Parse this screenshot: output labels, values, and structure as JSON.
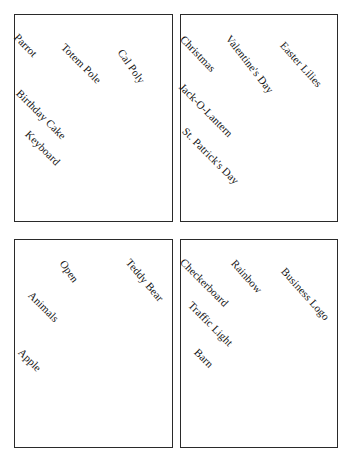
{
  "figure": {
    "type": "scatter-label-panels",
    "background_color": "#ffffff",
    "border_color": "#2a2a2a",
    "text_color": "#151515",
    "panel_count": 4,
    "grid": "2x2"
  },
  "panels": [
    {
      "id": "panel-top-left",
      "x": 14,
      "y": 14,
      "width": 159,
      "height": 208,
      "labels": [
        {
          "text": "Parrot",
          "x": 16,
          "y": 30,
          "angle": 46
        },
        {
          "text": "Totem Pole",
          "x": 63,
          "y": 40,
          "angle": 45
        },
        {
          "text": "Cal Poly",
          "x": 120,
          "y": 45,
          "angle": 55
        },
        {
          "text": "Birthday Cake",
          "x": 18,
          "y": 86,
          "angle": 45
        },
        {
          "text": "Keyboard",
          "x": 27,
          "y": 127,
          "angle": 45
        }
      ]
    },
    {
      "id": "panel-top-right",
      "x": 180,
      "y": 14,
      "width": 158,
      "height": 208,
      "labels": [
        {
          "text": "Christmas",
          "x": 182,
          "y": 32,
          "angle": 46
        },
        {
          "text": "Valentine's Day",
          "x": 228,
          "y": 31,
          "angle": 52
        },
        {
          "text": "Easter Lilies",
          "x": 282,
          "y": 38,
          "angle": 48
        },
        {
          "text": "Jack-O-Lantern",
          "x": 181,
          "y": 80,
          "angle": 45
        },
        {
          "text": "St. Patrick's Day",
          "x": 184,
          "y": 124,
          "angle": 45
        }
      ]
    },
    {
      "id": "panel-bottom-left",
      "x": 14,
      "y": 239,
      "width": 159,
      "height": 209,
      "labels": [
        {
          "text": "Open",
          "x": 62,
          "y": 256,
          "angle": 55
        },
        {
          "text": "Teddy Bear",
          "x": 128,
          "y": 255,
          "angle": 50
        },
        {
          "text": "Animals",
          "x": 30,
          "y": 288,
          "angle": 45
        },
        {
          "text": "Apple",
          "x": 20,
          "y": 345,
          "angle": 45
        }
      ]
    },
    {
      "id": "panel-bottom-right",
      "x": 180,
      "y": 239,
      "width": 158,
      "height": 209,
      "labels": [
        {
          "text": "Checkerboard",
          "x": 182,
          "y": 255,
          "angle": 45
        },
        {
          "text": "Rainbow",
          "x": 233,
          "y": 256,
          "angle": 48
        },
        {
          "text": "Business Logo",
          "x": 283,
          "y": 264,
          "angle": 48
        },
        {
          "text": "Traffic Light",
          "x": 190,
          "y": 298,
          "angle": 45
        },
        {
          "text": "Barn",
          "x": 196,
          "y": 345,
          "angle": 45
        }
      ]
    }
  ]
}
